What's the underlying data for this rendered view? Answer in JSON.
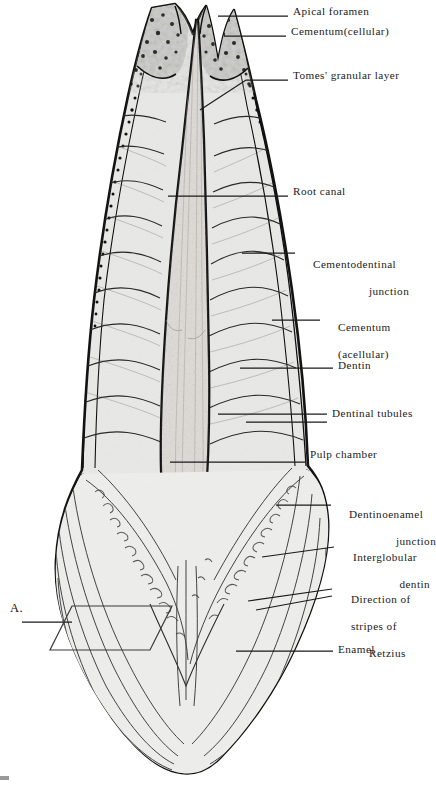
{
  "figure": {
    "domain": "anatomical-illustration",
    "panel_marker": "A.",
    "ink_color": "#1a1a1a",
    "fill_color": "#e9e9e7",
    "enamel_fill": "#ededeb",
    "cementum_fill": "#cfcfcc",
    "background": "#ffffff",
    "width": 434,
    "height": 785
  },
  "labels": [
    {
      "id": "apical-foramen",
      "text": "Apical foramen",
      "x": 293,
      "y": 11,
      "align": "left",
      "lines": [
        "Apical foramen"
      ]
    },
    {
      "id": "cementum-cellular",
      "text": "Cementum(cellular)",
      "x": 291,
      "y": 31,
      "align": "left",
      "lines": [
        "Cementum(cellular)"
      ]
    },
    {
      "id": "tomes-granular-layer",
      "text": "Tomes' granular layer",
      "x": 293,
      "y": 71,
      "align": "left",
      "lines": [
        "Tomes' granular layer"
      ]
    },
    {
      "id": "root-canal",
      "text": "Root canal",
      "x": 293,
      "y": 187,
      "align": "left",
      "lines": [
        "Root canal"
      ]
    },
    {
      "id": "cementodentinal-junction",
      "text": "Cementodentinal junction",
      "x": 300,
      "y": 247,
      "align": "left",
      "lines": [
        "Cementodentinal",
        "junction"
      ]
    },
    {
      "id": "cementum-acellular",
      "text": "Cementum (acellular)",
      "x": 325,
      "y": 311,
      "align": "left",
      "lines": [
        "Cementum",
        "(acellular)"
      ]
    },
    {
      "id": "dentin",
      "text": "Dentin",
      "x": 338,
      "y": 361,
      "align": "left",
      "lines": [
        "Dentin"
      ]
    },
    {
      "id": "dentinal-tubules",
      "text": "Dentinal tubules",
      "x": 332,
      "y": 409,
      "align": "left",
      "lines": [
        "Dentinal tubules"
      ]
    },
    {
      "id": "pulp-chamber",
      "text": "Pulp chamber",
      "x": 310,
      "y": 450,
      "align": "left",
      "lines": [
        "Pulp chamber"
      ]
    },
    {
      "id": "dentinoenamel-junction",
      "text": "Dentinoenamel junction",
      "x": 336,
      "y": 497,
      "align": "left",
      "lines": [
        "Dentinoenamel",
        "junction"
      ]
    },
    {
      "id": "interglobular-dentin",
      "text": "Interglobular dentin",
      "x": 340,
      "y": 540,
      "align": "left",
      "lines": [
        "Interglobular",
        "dentin"
      ]
    },
    {
      "id": "direction-of-stripes-of-retzius",
      "text": "Direction of stripes of Retzius",
      "x": 338,
      "y": 582,
      "align": "left",
      "lines": [
        "Direction of",
        "stripes of",
        "Retzius"
      ]
    },
    {
      "id": "enamel",
      "text": "Enamel",
      "x": 338,
      "y": 644,
      "align": "left",
      "lines": [
        "Enamel"
      ]
    }
  ],
  "leaders": [
    {
      "id": "leader-apical-foramen",
      "points": "218,16 288,16"
    },
    {
      "id": "leader-cementum-cellular",
      "points": "224,36 286,36"
    },
    {
      "id": "leader-tomes-granular-layer",
      "points": "200,108 245,80 288,80"
    },
    {
      "id": "leader-root-canal",
      "points": "168,196 288,196"
    },
    {
      "id": "leader-cementodentinal-junction",
      "points": "242,253 295,253"
    },
    {
      "id": "leader-cementum-acellular",
      "points": "272,320 320,320"
    },
    {
      "id": "leader-dentin",
      "points": "240,368 333,368"
    },
    {
      "id": "leader-dentinal-tubules-a",
      "points": "218,414 327,414"
    },
    {
      "id": "leader-dentinal-tubules-b",
      "points": "245,422 327,422"
    },
    {
      "id": "leader-pulp-chamber",
      "points": "170,462 305,462"
    },
    {
      "id": "leader-dentinoenamel-junction",
      "points": "276,505 331,505"
    },
    {
      "id": "leader-interglobular-dentin",
      "points": "262,556 334,547"
    },
    {
      "id": "leader-direction-retzius-a",
      "points": "250,600 332,589"
    },
    {
      "id": "leader-direction-retzius-b",
      "points": "258,608 332,596"
    },
    {
      "id": "leader-enamel",
      "points": "236,651 333,651"
    },
    {
      "id": "leader-panel-A",
      "points": "22,622 70,622"
    }
  ],
  "structures": [
    {
      "id": "root-apex",
      "name": "bifid root apex with apical foramina"
    },
    {
      "id": "cementum-band",
      "name": "cementum layer along root surface"
    },
    {
      "id": "root-canal",
      "name": "root canal lumen"
    },
    {
      "id": "pulp-chamber",
      "name": "pulp chamber"
    },
    {
      "id": "dentin-body",
      "name": "dentin with contour lines of Owen"
    },
    {
      "id": "enamel-cap",
      "name": "enamel crown with stripes of Retzius"
    },
    {
      "id": "dej",
      "name": "dentinoenamel junction"
    },
    {
      "id": "interglobular",
      "name": "interglobular dentin granules"
    }
  ]
}
